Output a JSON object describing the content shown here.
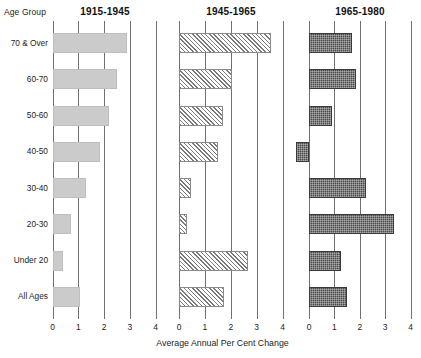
{
  "axis_group_header": "Age Group",
  "x_caption": "Average Annual Per Cent Change",
  "chart_data": {
    "type": "bar",
    "orientation": "horizontal",
    "title": "",
    "subtitle": "",
    "xlabel": "Average Annual Per Cent Change",
    "ylabel": "Age Group",
    "grid": true,
    "legend": "none",
    "panel_layout": "3 side-by-side small multiples sharing the category axis",
    "xlim": [
      0,
      4
    ],
    "xticks": [
      0,
      1,
      2,
      3,
      4
    ],
    "xtick_labels": [
      "0",
      "1",
      "2",
      "3",
      "4"
    ],
    "categories": [
      "70 & Over",
      "60-70",
      "50-60",
      "40-50",
      "30-40",
      "20-30",
      "Under 20",
      "All Ages"
    ],
    "series": [
      {
        "name": "1915-1945",
        "fill": "light-grey-dotted",
        "color": "#cbcbcb",
        "values": [
          2.9,
          2.5,
          2.2,
          1.85,
          1.3,
          0.72,
          0.42,
          1.05
        ]
      },
      {
        "name": "1945-1965",
        "fill": "diagonal-hatch",
        "color": "#7a7a7a",
        "values": [
          3.55,
          2.05,
          1.7,
          1.5,
          0.45,
          0.3,
          2.65,
          1.75
        ]
      },
      {
        "name": "1965-1980",
        "fill": "dark-checker",
        "color": "#4a4a4a",
        "values": [
          1.7,
          1.85,
          0.9,
          -0.5,
          2.25,
          3.35,
          1.25,
          1.5
        ]
      }
    ]
  },
  "panels": [
    {
      "title": "1915-1945"
    },
    {
      "title": "1945-1965"
    },
    {
      "title": "1965-1980"
    }
  ]
}
